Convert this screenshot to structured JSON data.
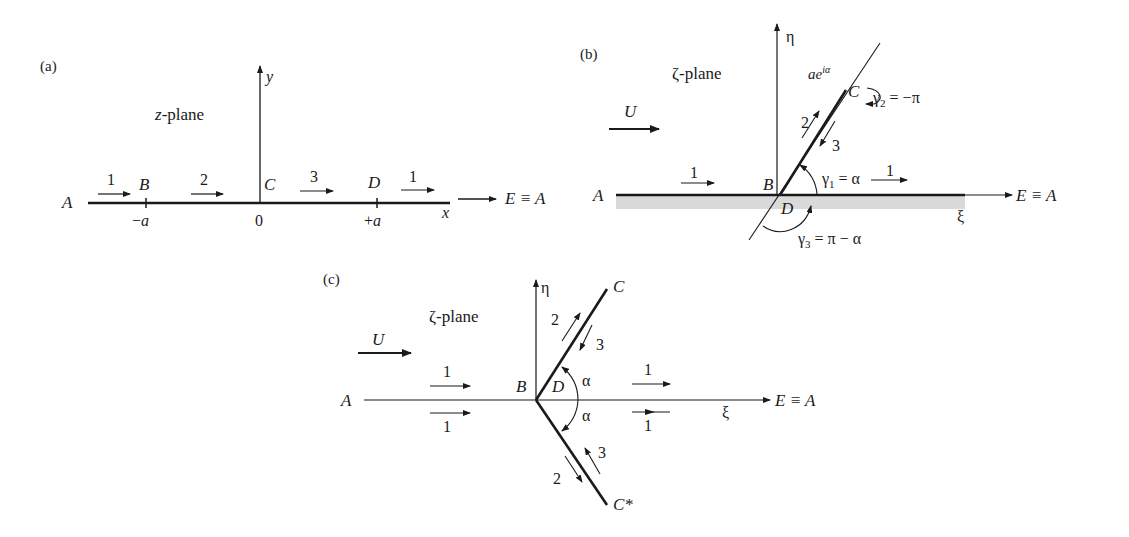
{
  "panel_a": {
    "label": "(a)",
    "plane": "z-plane",
    "y_axis": "y",
    "x_axis": "x",
    "points": {
      "A": "A",
      "B": "B",
      "C": "C",
      "D": "D",
      "E": "E ≡ A"
    },
    "ticks": {
      "minus_a": "−a",
      "zero": "0",
      "plus_a": "+a"
    },
    "segments": [
      "1",
      "2",
      "3",
      "1"
    ]
  },
  "panel_b": {
    "label": "(b)",
    "plane": "ζ-plane",
    "eta_axis": "η",
    "xi_axis": "ξ",
    "flow": "U",
    "points": {
      "A": "A",
      "B": "B",
      "C": "C",
      "D": "D",
      "E": "E ≡ A"
    },
    "tip_label": "ae",
    "tip_exp": "iα",
    "segments": [
      "1",
      "2",
      "3",
      "1"
    ],
    "angles": {
      "g1": "γ",
      "g1_sub": "1",
      "g1_val": " = α",
      "g2": "γ",
      "g2_sub": "2",
      "g2_val": " = −π",
      "g3": "γ",
      "g3_sub": "3",
      "g3_val": " = π − α"
    }
  },
  "panel_c": {
    "label": "(c)",
    "plane": "ζ-plane",
    "eta_axis": "η",
    "xi_axis": "ξ",
    "flow": "U",
    "points": {
      "A": "A",
      "B": "B",
      "C": "C",
      "C_star": "C*",
      "D": "D",
      "E": "E ≡ A"
    },
    "segments": [
      "1",
      "1",
      "1",
      "1",
      "2",
      "3",
      "2",
      "3"
    ],
    "angles": [
      "α",
      "α"
    ]
  }
}
